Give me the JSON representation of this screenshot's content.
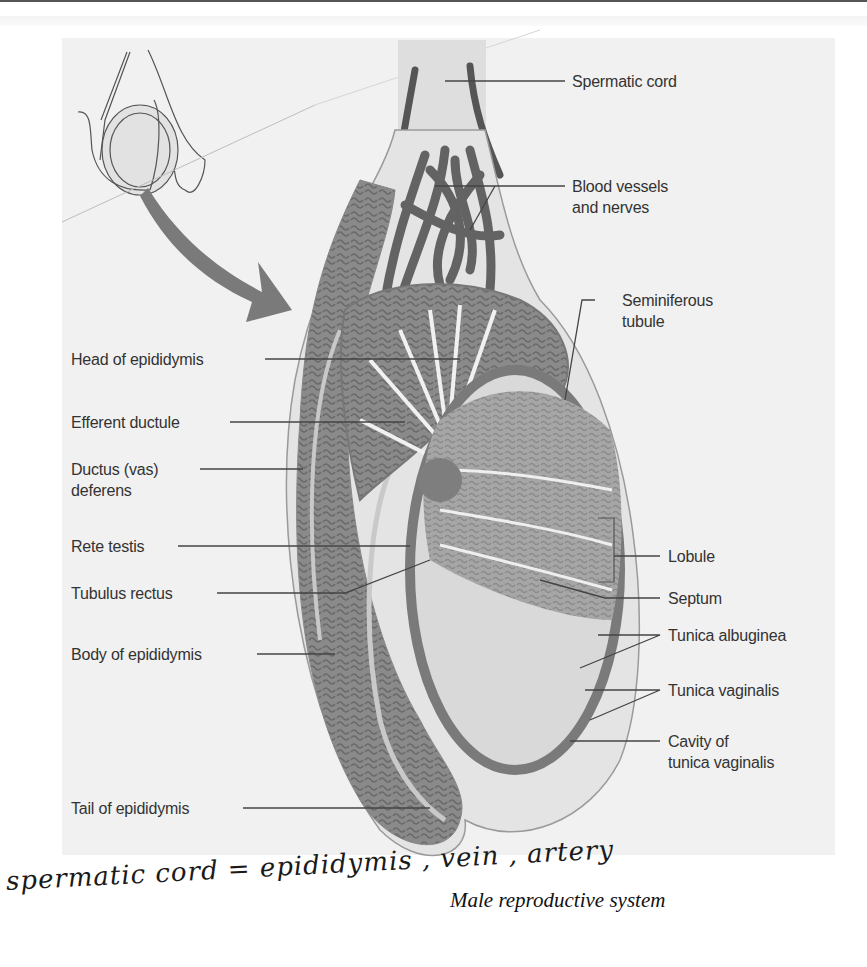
{
  "figure": {
    "caption": "Male reproductive system",
    "handwritten_note": "spermatic cord = epididymis , vein , artery",
    "labels_left": [
      {
        "id": "head-of-epididymis",
        "text": "Head of epididymis"
      },
      {
        "id": "efferent-ductule",
        "text": "Efferent ductule"
      },
      {
        "id": "ductus-deferens",
        "line1": "Ductus (vas)",
        "line2": "deferens"
      },
      {
        "id": "rete-testis",
        "text": "Rete testis"
      },
      {
        "id": "tubulus-rectus",
        "text": "Tubulus rectus"
      },
      {
        "id": "body-of-epididymis",
        "text": "Body of epididymis"
      },
      {
        "id": "tail-of-epididymis",
        "text": "Tail of epididymis"
      }
    ],
    "labels_right": [
      {
        "id": "spermatic-cord",
        "text": "Spermatic cord"
      },
      {
        "id": "blood-vessels",
        "line1": "Blood vessels",
        "line2": "and nerves"
      },
      {
        "id": "seminiferous-tubule",
        "line1": "Seminiferous",
        "line2": "tubule"
      },
      {
        "id": "lobule",
        "text": "Lobule"
      },
      {
        "id": "septum",
        "text": "Septum"
      },
      {
        "id": "tunica-albuginea",
        "text": "Tunica albuginea"
      },
      {
        "id": "tunica-vaginalis",
        "text": "Tunica vaginalis"
      },
      {
        "id": "cavity-tunica-vaginalis",
        "line1": "Cavity of",
        "line2": "tunica vaginalis"
      }
    ],
    "colors": {
      "panel_bg": "#f1f1f1",
      "tissue_dark": "#6e6e6e",
      "tissue_mid": "#8c8c8c",
      "tissue_light": "#a9a9a9",
      "leader_line": "#444444",
      "label_text": "#333333"
    }
  }
}
